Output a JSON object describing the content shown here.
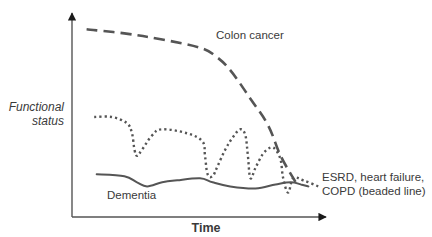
{
  "chart_data": {
    "type": "line",
    "title": "",
    "xlabel": "Time",
    "ylabel": "Functional status",
    "xlim": [
      0,
      100
    ],
    "ylim": [
      0,
      100
    ],
    "grid": false,
    "series": [
      {
        "name": "Colon cancer",
        "style": "dashed",
        "color": "#555555",
        "x": [
          5,
          20,
          35,
          50,
          56,
          62,
          70,
          77,
          82,
          88
        ],
        "y": [
          92,
          90,
          87,
          83,
          79,
          72,
          58,
          45,
          30,
          17
        ]
      },
      {
        "name": "ESRD, heart failure, COPD (beaded line)",
        "style": "dotted",
        "color": "#555555",
        "x": [
          8,
          15,
          21,
          23,
          24,
          25,
          27,
          31,
          35,
          45,
          51,
          52,
          53,
          55,
          57,
          60,
          63,
          66,
          68,
          69,
          70,
          72,
          75,
          78,
          80,
          82,
          83,
          85,
          87,
          91,
          97
        ],
        "y": [
          49,
          49,
          46,
          41,
          33,
          30,
          33,
          40,
          43,
          41,
          37,
          30,
          21,
          20,
          25,
          33,
          39,
          43,
          40,
          30,
          19,
          24,
          31,
          34,
          33,
          28,
          19,
          12,
          19,
          18,
          15
        ]
      },
      {
        "name": "Dementia",
        "style": "solid",
        "color": "#555555",
        "x": [
          9,
          20,
          25,
          29,
          35,
          41,
          50,
          55,
          62,
          72,
          80,
          86,
          90,
          93
        ],
        "y": [
          21,
          20,
          17,
          15,
          17,
          18,
          19,
          17,
          15,
          14,
          16,
          17,
          16,
          15
        ]
      }
    ],
    "annotations": [
      {
        "text": "Colon cancer",
        "near": "top-right of dashed line"
      },
      {
        "text": "Dementia",
        "near": "below solid line"
      },
      {
        "text": "ESRD, heart failure,",
        "near": "right end of dotted line"
      },
      {
        "text": "COPD (beaded line)",
        "near": "right end of dotted line"
      }
    ],
    "legend": "none (inline labels)"
  },
  "labels": {
    "ylabel_line1": "Functional",
    "ylabel_line2": "status",
    "xlabel": "Time",
    "colon": "Colon cancer",
    "dementia": "Dementia",
    "esrd_line1": "ESRD, heart failure,",
    "esrd_line2": "COPD (beaded line)"
  }
}
